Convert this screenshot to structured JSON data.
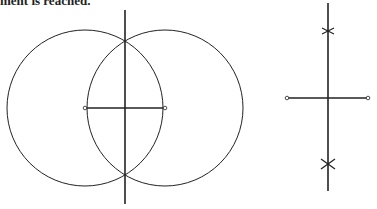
{
  "caption": "ment is reached.",
  "colors": {
    "stroke": "#222222",
    "background": "#ffffff"
  },
  "figure_left": {
    "description": "Perpendicular bisector construction with two intersecting circles",
    "segment": {
      "x1": 85,
      "y1": 108,
      "x2": 165,
      "y2": 108
    },
    "circles": [
      {
        "cx": 85,
        "cy": 108,
        "r": 78
      },
      {
        "cx": 165,
        "cy": 108,
        "r": 78
      }
    ],
    "bisector": {
      "x": 125,
      "y1": 10,
      "y2": 204
    },
    "intersections": [
      {
        "x": 125,
        "y": 40
      },
      {
        "x": 125,
        "y": 175
      }
    ]
  },
  "figure_right": {
    "description": "Perpendicular bisector with arc crossing marks",
    "segment": {
      "x1": 287,
      "y1": 98,
      "x2": 368,
      "y2": 98
    },
    "bisector": {
      "x": 328,
      "y1": 3,
      "y2": 191
    },
    "marks": [
      {
        "x": 328,
        "y": 31
      },
      {
        "x": 328,
        "y": 164
      }
    ]
  }
}
